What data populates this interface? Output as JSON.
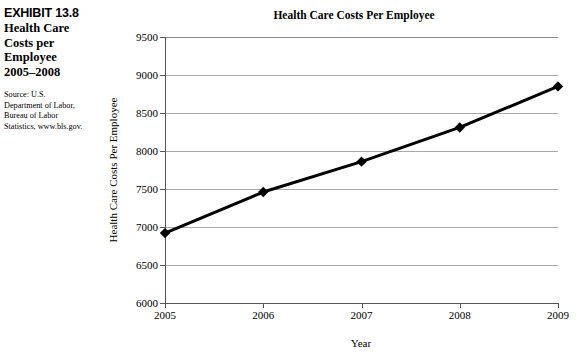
{
  "caption": {
    "exhibit_number": "EXHIBIT 13.8",
    "title_lines": [
      "Health Care",
      "Costs per",
      "Employee",
      "2005–2008"
    ],
    "source_lines": [
      "Source: U.S.",
      "Department of Labor,",
      "Bureau of Labor",
      "Statistics, www.bls.gov."
    ]
  },
  "chart_data": {
    "type": "line",
    "title": "Health Care Costs Per Employee",
    "xlabel": "Year",
    "ylabel": "Health Care Costs Per Employee",
    "categories": [
      "2005",
      "2006",
      "2007",
      "2008",
      "2009"
    ],
    "x_tick_labels": [
      "2005",
      "2006",
      "2007",
      "2008",
      "2009"
    ],
    "y_tick_labels": [
      "6000",
      "6500",
      "7000",
      "7500",
      "8000",
      "8500",
      "9000",
      "9500"
    ],
    "y_ticks": [
      6000,
      6500,
      7000,
      7500,
      8000,
      8500,
      9000,
      9500
    ],
    "ylim": [
      6000,
      9500
    ],
    "values": [
      6920,
      7460,
      7860,
      8310,
      8850
    ],
    "series": [
      {
        "name": "Health Care Costs Per Employee",
        "values": [
          6920,
          7460,
          7860,
          8310,
          8850
        ]
      }
    ],
    "grid": "horizontal",
    "legend": "none",
    "marker": "diamond",
    "line_color": "#000000",
    "marker_color": "#000000",
    "grid_color": "#a9a9a9",
    "background_color": "#ffffff"
  }
}
